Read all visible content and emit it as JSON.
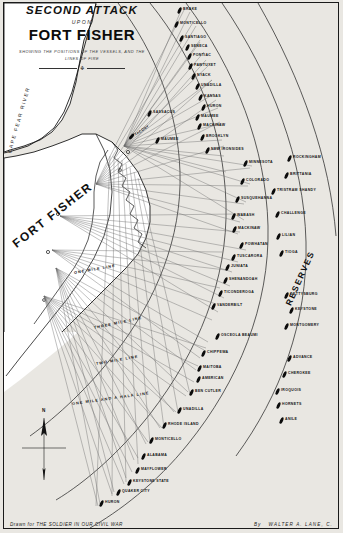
{
  "title": {
    "line1": "SECOND ATTACK",
    "upon": "UPON",
    "main": "FORT FISHER",
    "subtitle1": "SHOWING THE POSITIONS OF THE VESSELS, AND THE",
    "subtitle2": "LINES OF FIRE",
    "rule_ornament": "❖"
  },
  "footer": {
    "drawn_for": "Drawn for THE SOLDIER IN OUR CIVIL WAR",
    "by_label": "By",
    "artist": "WALTER A. LANE, C."
  },
  "geography": {
    "fort": "FORT FISHER",
    "river": "CAPE FEAR RIVER",
    "reserves": "RESERVES"
  },
  "compass": {
    "north": "N"
  },
  "range_lines": [
    {
      "label": "ONE MILE LINE",
      "x": 74,
      "y": 271,
      "rot": -10
    },
    {
      "label": "THREE MILE LINE",
      "x": 94,
      "y": 326,
      "rot": -12
    },
    {
      "label": "TWO MILE LINE",
      "x": 96,
      "y": 362,
      "rot": -10
    },
    {
      "label": "ONE MILE AND A HALF LINE",
      "x": 72,
      "y": 402,
      "rot": -8
    }
  ],
  "vessels": [
    {
      "name": "BRAKE",
      "x": 178,
      "y": 10,
      "side": "right",
      "tilt": false
    },
    {
      "name": "MONTICELLO",
      "x": 175,
      "y": 24,
      "side": "right",
      "tilt": false
    },
    {
      "name": "SANTIAGO",
      "x": 180,
      "y": 38,
      "side": "right",
      "tilt": false
    },
    {
      "name": "SENECA",
      "x": 186,
      "y": 47,
      "side": "right",
      "tilt": false
    },
    {
      "name": "PONTIAC",
      "x": 188,
      "y": 56,
      "side": "right",
      "tilt": false
    },
    {
      "name": "PAWTUXET",
      "x": 189,
      "y": 66,
      "side": "right",
      "tilt": false
    },
    {
      "name": "NYACK",
      "x": 192,
      "y": 76,
      "side": "right",
      "tilt": false
    },
    {
      "name": "UNADILLA",
      "x": 196,
      "y": 86,
      "side": "right",
      "tilt": false
    },
    {
      "name": "KANSAS",
      "x": 199,
      "y": 97,
      "side": "right",
      "tilt": false
    },
    {
      "name": "HURON",
      "x": 202,
      "y": 107,
      "side": "right",
      "tilt": false
    },
    {
      "name": "MAUMEE",
      "x": 196,
      "y": 117,
      "side": "right",
      "tilt": false
    },
    {
      "name": "SASSACUS",
      "x": 148,
      "y": 113,
      "side": "right",
      "tilt": false
    },
    {
      "name": "MACKINAW",
      "x": 198,
      "y": 126,
      "side": "right",
      "tilt": false
    },
    {
      "name": "TACONY",
      "x": 130,
      "y": 136,
      "side": "right",
      "tilt": true
    },
    {
      "name": "MAUMEE",
      "x": 156,
      "y": 140,
      "side": "right",
      "tilt": false
    },
    {
      "name": "BROOKLYN",
      "x": 201,
      "y": 137,
      "side": "right",
      "tilt": false
    },
    {
      "name": "NEW IRONSIDES",
      "x": 206,
      "y": 150,
      "side": "right",
      "tilt": false
    },
    {
      "name": "MINNESOTA",
      "x": 244,
      "y": 163,
      "side": "right",
      "tilt": false
    },
    {
      "name": "ROCKINGHAM",
      "x": 288,
      "y": 158,
      "side": "right",
      "tilt": false
    },
    {
      "name": "COLORADO",
      "x": 241,
      "y": 181,
      "side": "right",
      "tilt": false
    },
    {
      "name": "BRITTANIA",
      "x": 285,
      "y": 175,
      "side": "right",
      "tilt": false
    },
    {
      "name": "TRISTRAM SHANDY",
      "x": 272,
      "y": 191,
      "side": "right",
      "tilt": false
    },
    {
      "name": "SUSQUEHANNA",
      "x": 236,
      "y": 199,
      "side": "right",
      "tilt": false
    },
    {
      "name": "WABASH",
      "x": 232,
      "y": 216,
      "side": "right",
      "tilt": false
    },
    {
      "name": "CHALLENGE",
      "x": 276,
      "y": 214,
      "side": "right",
      "tilt": false
    },
    {
      "name": "MACKINAW",
      "x": 233,
      "y": 229,
      "side": "right",
      "tilt": false
    },
    {
      "name": "POWHATAN",
      "x": 240,
      "y": 245,
      "side": "right",
      "tilt": false
    },
    {
      "name": "LILIAN",
      "x": 277,
      "y": 236,
      "side": "right",
      "tilt": false
    },
    {
      "name": "TUSCARORA",
      "x": 232,
      "y": 257,
      "side": "right",
      "tilt": false
    },
    {
      "name": "JUNIATA",
      "x": 226,
      "y": 267,
      "side": "right",
      "tilt": false
    },
    {
      "name": "TIOGA",
      "x": 280,
      "y": 253,
      "side": "right",
      "tilt": false
    },
    {
      "name": "SHENANDOAH",
      "x": 224,
      "y": 280,
      "side": "right",
      "tilt": false
    },
    {
      "name": "TICONDEROGA",
      "x": 219,
      "y": 293,
      "side": "right",
      "tilt": false
    },
    {
      "name": "VANDERBILT",
      "x": 212,
      "y": 306,
      "side": "right",
      "tilt": false
    },
    {
      "name": "GETTYSBURG",
      "x": 285,
      "y": 295,
      "side": "right",
      "tilt": false
    },
    {
      "name": "KEYSTONE",
      "x": 290,
      "y": 310,
      "side": "right",
      "tilt": false
    },
    {
      "name": "MONTGOMERY",
      "x": 285,
      "y": 326,
      "side": "right",
      "tilt": false
    },
    {
      "name": "OSCEOLA BEAUMI",
      "x": 216,
      "y": 336,
      "side": "right",
      "tilt": false
    },
    {
      "name": "CHIPPEWA",
      "x": 202,
      "y": 353,
      "side": "right",
      "tilt": false
    },
    {
      "name": "ADVANCE",
      "x": 288,
      "y": 358,
      "side": "right",
      "tilt": false
    },
    {
      "name": "MAITOBA",
      "x": 198,
      "y": 368,
      "side": "right",
      "tilt": false
    },
    {
      "name": "AMERICAN",
      "x": 197,
      "y": 379,
      "side": "right",
      "tilt": false
    },
    {
      "name": "CHEROKEE",
      "x": 283,
      "y": 374,
      "side": "right",
      "tilt": false
    },
    {
      "name": "IROQUOIS",
      "x": 276,
      "y": 391,
      "side": "right",
      "tilt": false
    },
    {
      "name": "BEN CUTLER",
      "x": 190,
      "y": 392,
      "side": "right",
      "tilt": false
    },
    {
      "name": "HORNETS",
      "x": 277,
      "y": 405,
      "side": "right",
      "tilt": false
    },
    {
      "name": "UNADILLA",
      "x": 178,
      "y": 410,
      "side": "right",
      "tilt": false
    },
    {
      "name": "ANILE",
      "x": 280,
      "y": 420,
      "side": "right",
      "tilt": false
    },
    {
      "name": "RHODE ISLAND",
      "x": 163,
      "y": 425,
      "side": "right",
      "tilt": false
    },
    {
      "name": "MONTICELLO",
      "x": 150,
      "y": 440,
      "side": "right",
      "tilt": false
    },
    {
      "name": "ALABAMA",
      "x": 142,
      "y": 456,
      "side": "right",
      "tilt": false
    },
    {
      "name": "MAYFLOWER",
      "x": 136,
      "y": 470,
      "side": "right",
      "tilt": false
    },
    {
      "name": "KEYSTONE STATE",
      "x": 128,
      "y": 482,
      "side": "right",
      "tilt": false
    },
    {
      "name": "QUAKER CITY",
      "x": 117,
      "y": 492,
      "side": "right",
      "tilt": false
    },
    {
      "name": "HURON",
      "x": 100,
      "y": 503,
      "side": "right",
      "tilt": false
    }
  ],
  "colors": {
    "paper": "#e9e7e2",
    "ink": "#121212",
    "fire_line": "#555555",
    "land": "#ffffff"
  }
}
